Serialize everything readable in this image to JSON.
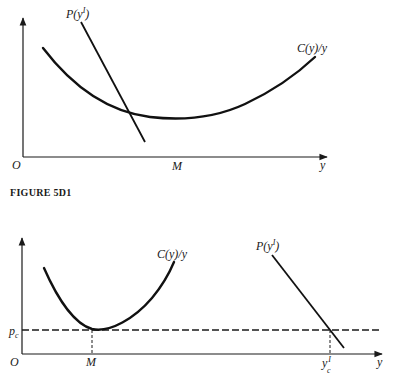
{
  "top_diagram": {
    "axis_origin_label": "O",
    "x_axis_label": "y",
    "x_tick_label": "M",
    "curve_label": "C(y)/y",
    "line_label_prefix": "P(y",
    "line_label_superscript": "I",
    "line_label_suffix": ")"
  },
  "caption": {
    "text": "FIGURE 5D1"
  },
  "bottom_diagram": {
    "axis_origin_label": "O",
    "x_axis_label": "y",
    "x_tick_label": "M",
    "y_tick_label_main": "p",
    "y_tick_label_sub": "c",
    "x_tick2_label_main": "y",
    "x_tick2_label_sup": "I",
    "x_tick2_label_sub": "c",
    "curve_label": "C(y)/y",
    "line_label_prefix": "P(y",
    "line_label_superscript": "I",
    "line_label_suffix": ")"
  },
  "colors": {
    "ink": "#111111",
    "background": "#ffffff"
  }
}
